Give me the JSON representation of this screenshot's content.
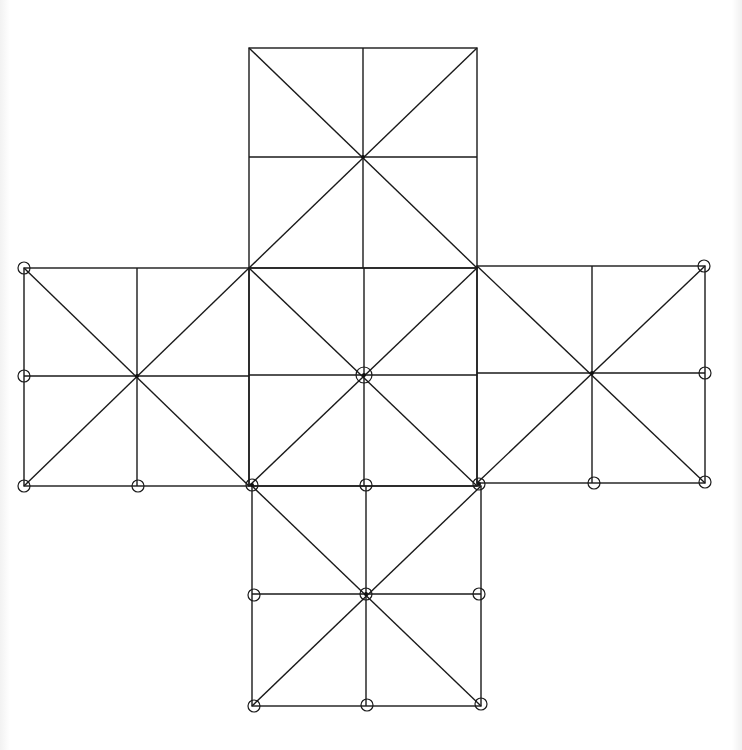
{
  "diagram": {
    "type": "cube-net-grid",
    "colors": {
      "line": "#1a1a1a",
      "background": "#ffffff"
    },
    "squares": [
      {
        "id": "top",
        "x1": 249,
        "y1": 48,
        "x2": 477,
        "y2": 268,
        "cx": 363,
        "cy": 157
      },
      {
        "id": "left",
        "x1": 24,
        "y1": 268,
        "x2": 249,
        "y2": 486,
        "cx": 137,
        "cy": 376
      },
      {
        "id": "center",
        "x1": 249,
        "y1": 268,
        "x2": 477,
        "y2": 486,
        "cx": 364,
        "cy": 375
      },
      {
        "id": "right",
        "x1": 477,
        "y1": 266,
        "x2": 705,
        "y2": 483,
        "cx": 592,
        "cy": 373
      },
      {
        "id": "bottom",
        "x1": 252,
        "y1": 486,
        "x2": 481,
        "y2": 706,
        "cx": 366,
        "cy": 594
      }
    ],
    "circles": [
      {
        "x": 24,
        "y": 268,
        "r": 6
      },
      {
        "x": 24,
        "y": 376,
        "r": 6
      },
      {
        "x": 24,
        "y": 486,
        "r": 6
      },
      {
        "x": 138,
        "y": 486,
        "r": 6
      },
      {
        "x": 252,
        "y": 485,
        "r": 6
      },
      {
        "x": 366,
        "y": 485,
        "r": 6
      },
      {
        "x": 479,
        "y": 484,
        "r": 6
      },
      {
        "x": 594,
        "y": 483,
        "r": 6
      },
      {
        "x": 705,
        "y": 482,
        "r": 6
      },
      {
        "x": 705,
        "y": 373,
        "r": 6
      },
      {
        "x": 704,
        "y": 266,
        "r": 6
      },
      {
        "x": 364,
        "y": 375,
        "r": 8
      },
      {
        "x": 254,
        "y": 595,
        "r": 6
      },
      {
        "x": 366,
        "y": 594,
        "r": 6
      },
      {
        "x": 479,
        "y": 594,
        "r": 6
      },
      {
        "x": 254,
        "y": 706,
        "r": 6
      },
      {
        "x": 367,
        "y": 705,
        "r": 6
      },
      {
        "x": 481,
        "y": 704,
        "r": 6
      }
    ],
    "center_dots": [
      {
        "x": 363,
        "y": 157
      },
      {
        "x": 137,
        "y": 376
      },
      {
        "x": 364,
        "y": 375
      },
      {
        "x": 592,
        "y": 373
      },
      {
        "x": 366,
        "y": 594
      },
      {
        "x": 252,
        "y": 485
      },
      {
        "x": 479,
        "y": 484
      }
    ]
  }
}
